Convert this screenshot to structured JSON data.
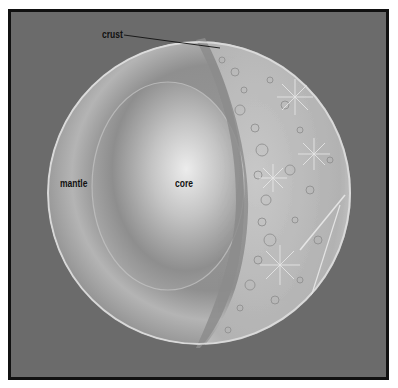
{
  "diagram": {
    "title": "",
    "labels": {
      "crust": "crust",
      "mantle": "mantle",
      "core": "core"
    },
    "colors": {
      "background": "#6b6b6b",
      "frame": "#111111",
      "mantle": "#a8a8a8",
      "core_center": "#e6e6e6",
      "core_edge": "#7a7a7a",
      "surface": "#bdbdbd",
      "label_text": "#111111"
    }
  }
}
